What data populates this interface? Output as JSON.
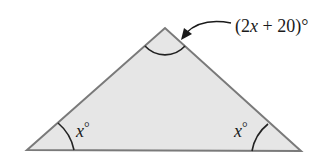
{
  "diagram": {
    "type": "triangle",
    "vertices": {
      "left": [
        27,
        150
      ],
      "top": [
        165,
        28
      ],
      "right": [
        301,
        151
      ]
    },
    "colors": {
      "fill": "#e6e6e6",
      "stroke": "#7a7a7a",
      "arc": "#222222",
      "text": "#1a1a1a"
    },
    "labels": {
      "apex": {
        "open": "(2",
        "var": "x",
        "rest": " + 20)°"
      },
      "left": {
        "var": "x",
        "deg": "°"
      },
      "right": {
        "var": "x",
        "deg": "°"
      }
    }
  }
}
